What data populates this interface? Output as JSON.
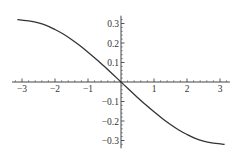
{
  "chart_data": {
    "type": "line",
    "title": "",
    "xlabel": "",
    "ylabel": "",
    "xlim": [
      -3.3,
      3.3
    ],
    "ylim": [
      -0.34,
      0.34
    ],
    "grid": false,
    "legend": null,
    "x_ticks": [
      -3,
      -2,
      -1,
      1,
      2,
      3
    ],
    "x_tick_labels": [
      "−3",
      "−2",
      "−1",
      "1",
      "2",
      "3"
    ],
    "y_ticks": [
      0.3,
      0.2,
      0.1,
      -0.1,
      -0.2,
      -0.3
    ],
    "y_tick_labels": [
      "0.3",
      "0.2",
      "0.1",
      "−0.1",
      "−0.2",
      "−0.3"
    ],
    "series": [
      {
        "name": "f(x)",
        "color": "#333333",
        "x": [
          -3.14,
          -2.75,
          -2.5,
          -2.25,
          -2.0,
          -1.75,
          -1.5,
          -1.25,
          -1.0,
          -0.75,
          -0.5,
          -0.25,
          0.0,
          0.25,
          0.5,
          0.75,
          1.0,
          1.25,
          1.5,
          1.75,
          2.0,
          2.25,
          2.5,
          2.75,
          3.14
        ],
        "y": [
          0.32,
          0.312,
          0.303,
          0.289,
          0.269,
          0.246,
          0.218,
          0.187,
          0.153,
          0.117,
          0.079,
          0.04,
          0.0,
          -0.04,
          -0.079,
          -0.117,
          -0.153,
          -0.187,
          -0.218,
          -0.246,
          -0.269,
          -0.289,
          -0.303,
          -0.312,
          -0.32
        ]
      }
    ]
  },
  "axes": {
    "color": "#444444"
  }
}
